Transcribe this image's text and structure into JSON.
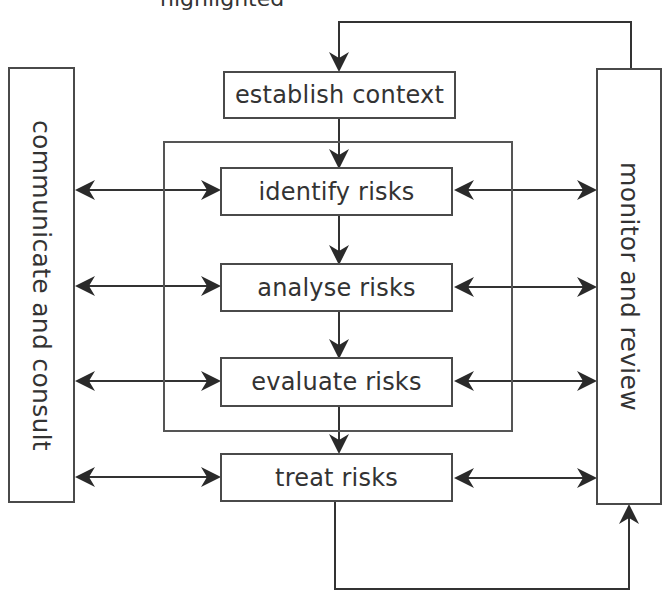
{
  "diagram": {
    "top_fragment": "highlighted",
    "steps": [
      {
        "id": "establish-context",
        "label": "establish context"
      },
      {
        "id": "identify-risks",
        "label": "identify risks"
      },
      {
        "id": "analyse-risks",
        "label": "analyse risks"
      },
      {
        "id": "evaluate-risks",
        "label": "evaluate risks"
      },
      {
        "id": "treat-risks",
        "label": "treat risks"
      }
    ],
    "left_panel": {
      "label": "communicate and consult"
    },
    "right_panel": {
      "label": "monitor and review"
    },
    "inner_group": {
      "contains": [
        "identify risks",
        "analyse risks",
        "evaluate risks"
      ]
    },
    "colors": {
      "stroke": "#333333",
      "box_border": "#4a4a4a",
      "background": "#ffffff",
      "text": "#333333"
    }
  }
}
